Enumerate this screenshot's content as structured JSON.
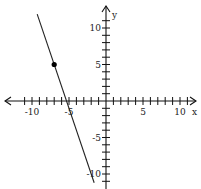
{
  "chart_data": {
    "type": "line",
    "title": "",
    "xlabel": "x",
    "ylabel": "y",
    "xlim": [
      -12,
      12
    ],
    "ylim": [
      -12,
      12
    ],
    "x_ticks": [
      -10,
      -5,
      5,
      10
    ],
    "y_ticks": [
      10,
      5,
      -5,
      -10
    ],
    "tick_interval": 1,
    "grid": false,
    "series": [
      {
        "name": "line",
        "slope": -3,
        "intercept": -16,
        "x": [
          -9.3,
          -1.6
        ],
        "y": [
          11.9,
          -11.2
        ]
      }
    ],
    "points": [
      {
        "x": -7,
        "y": 5,
        "filled": true
      }
    ]
  },
  "axes": {
    "x_label": "x",
    "y_label": "y",
    "x_tick_labels": [
      "-10",
      "-5",
      "5",
      "10"
    ],
    "y_tick_labels": [
      "10",
      "5",
      "-5",
      "-10"
    ]
  }
}
